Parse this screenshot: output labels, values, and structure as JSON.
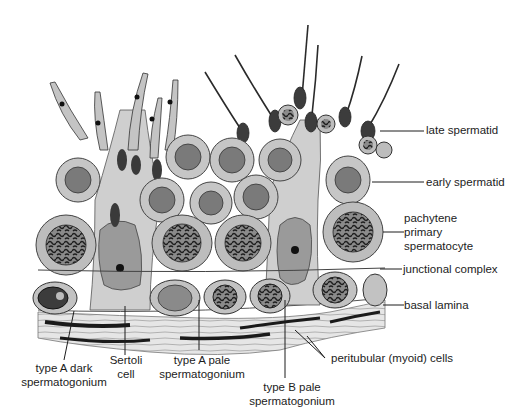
{
  "diagram": {
    "colors": {
      "background": "#ffffff",
      "cytoplasm": "#b8b8b8",
      "cytoplasm_light": "#d4d4d4",
      "nucleus": "#6e6e6e",
      "nucleus_dark": "#2a2a2a",
      "outline": "#3a3a3a",
      "connective_tissue": "#e2e2e2",
      "leader_line": "#1c1c1c",
      "label_text": "#1c1c1c"
    },
    "labels": {
      "late_spermatid": "late spermatid",
      "early_spermatid": "early spermatid",
      "pachytene_1": "pachytene",
      "pachytene_2": "primary",
      "pachytene_3": "spermatocyte",
      "junctional_complex": "junctional complex",
      "basal_lamina": "basal lamina",
      "type_a_dark_1": "type A dark",
      "type_a_dark_2": "spermatogonium",
      "sertoli_1": "Sertoli",
      "sertoli_2": "cell",
      "type_a_pale_1": "type A pale",
      "type_a_pale_2": "spermatogonium",
      "type_b_pale_1": "type B pale",
      "type_b_pale_2": "spermatogonium",
      "peritubular": "peritubular (myoid) cells"
    }
  }
}
